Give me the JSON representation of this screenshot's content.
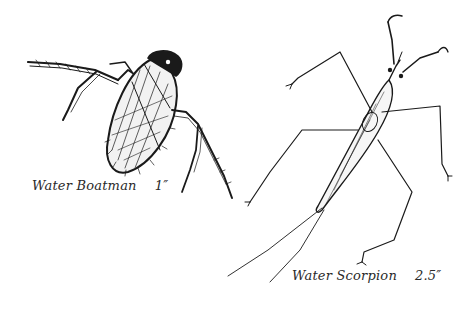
{
  "illustration": {
    "background": "#ffffff",
    "ink_color": "#1a1a1a",
    "specimens": [
      {
        "name": "Water Boatman",
        "size": "1″",
        "icon": "water-boatman-drawing"
      },
      {
        "name": "Water Scorpion",
        "size": "2.5″",
        "icon": "water-scorpion-drawing"
      }
    ]
  }
}
